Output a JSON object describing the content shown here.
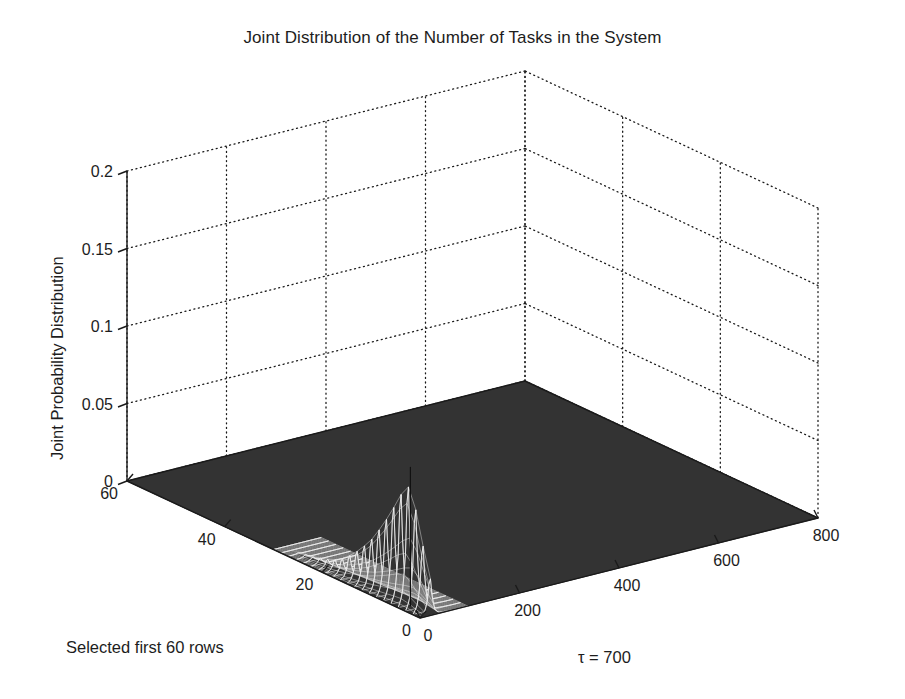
{
  "figure": {
    "title": "Joint Distribution of the Number of Tasks in the System",
    "background_color": "#ffffff",
    "surface_color": "#333333",
    "mesh_color": "#f2f2f2",
    "grid_color": "#1a1a1a",
    "axis_color": "#1a1a1a"
  },
  "chart_data": {
    "type": "surface",
    "title": "Joint Distribution of the Number of Tasks in the System",
    "xlabel": "τ = 700",
    "ylabel": "Selected first 60 rows",
    "zlabel": "Joint Probability Distribution",
    "xlim": [
      0,
      800
    ],
    "ylim": [
      0,
      60
    ],
    "zlim": [
      0,
      0.2
    ],
    "xticks": [
      "0",
      "200",
      "400",
      "600",
      "800"
    ],
    "xtick_values": [
      0,
      200,
      400,
      600,
      800
    ],
    "yticks": [
      "0",
      "20",
      "40",
      "60"
    ],
    "ytick_values": [
      0,
      20,
      40,
      60
    ],
    "zticks": [
      "0",
      "0.05",
      "0.1",
      "0.15",
      "0.2"
    ],
    "ztick_values": [
      0,
      0.05,
      0.1,
      0.15,
      0.2
    ],
    "grid": true,
    "legend": false,
    "peak": {
      "x": 20,
      "y": 4,
      "z": 0.09
    },
    "spike_profile_x": [
      0,
      5,
      10,
      15,
      20,
      25,
      30,
      35,
      40,
      50,
      60,
      80
    ],
    "spike_profile_z": [
      0.0,
      0.004,
      0.012,
      0.035,
      0.09,
      0.033,
      0.011,
      0.004,
      0.002,
      0.001,
      0.0005,
      0.0
    ],
    "spike_rows_y": [
      0,
      2,
      4,
      6,
      8,
      10,
      12,
      14,
      16,
      18,
      20,
      24,
      28
    ],
    "spike_rows_scale": [
      0.3,
      0.62,
      1.0,
      0.88,
      0.7,
      0.54,
      0.4,
      0.29,
      0.2,
      0.13,
      0.08,
      0.03,
      0.0
    ]
  }
}
